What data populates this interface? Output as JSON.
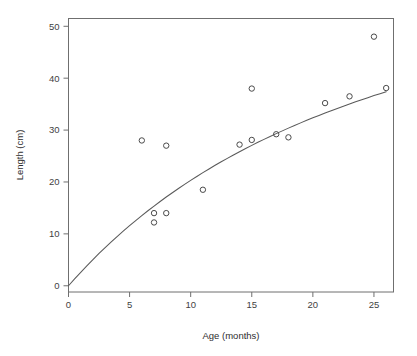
{
  "chart_data": {
    "type": "scatter",
    "title": "",
    "xlabel": "Age (months)",
    "ylabel": "Length (cm)",
    "xlim": [
      0,
      26.6
    ],
    "ylim": [
      -1.2,
      51.5
    ],
    "xticks": [
      0,
      5,
      10,
      15,
      20,
      25
    ],
    "xticklabels": [
      "0",
      "5",
      "10",
      "15",
      "20",
      "25"
    ],
    "yticks": [
      0,
      10,
      20,
      30,
      40,
      50
    ],
    "yticklabels": [
      "0",
      "10",
      "20",
      "30",
      "40",
      "50"
    ],
    "grid": false,
    "legend": false,
    "marker": "open-circle",
    "points": [
      {
        "x": 6.0,
        "y": 28.0
      },
      {
        "x": 7.0,
        "y": 14.0
      },
      {
        "x": 7.0,
        "y": 12.2
      },
      {
        "x": 8.0,
        "y": 27.0
      },
      {
        "x": 8.0,
        "y": 14.0
      },
      {
        "x": 11.0,
        "y": 18.5
      },
      {
        "x": 14.0,
        "y": 27.2
      },
      {
        "x": 15.0,
        "y": 28.1
      },
      {
        "x": 15.0,
        "y": 38.0
      },
      {
        "x": 17.0,
        "y": 29.2
      },
      {
        "x": 18.0,
        "y": 28.6
      },
      {
        "x": 21.0,
        "y": 35.2
      },
      {
        "x": 23.0,
        "y": 36.5
      },
      {
        "x": 25.0,
        "y": 48.0
      },
      {
        "x": 26.0,
        "y": 38.1
      }
    ],
    "fit_curve": {
      "name": "fitted growth curve",
      "x": [
        0.0,
        0.5,
        1.0,
        1.5,
        2.0,
        2.5,
        3.0,
        3.5,
        4.0,
        4.5,
        5.0,
        5.5,
        6.0,
        6.5,
        7.0,
        7.5,
        8.0,
        8.5,
        9.0,
        9.5,
        10.0,
        10.5,
        11.0,
        11.5,
        12.0,
        12.5,
        13.0,
        13.5,
        14.0,
        14.5,
        15.0,
        15.5,
        16.0,
        16.5,
        17.0,
        17.5,
        18.0,
        18.5,
        19.0,
        19.5,
        20.0,
        20.5,
        21.0,
        21.5,
        22.0,
        22.5,
        23.0,
        23.5,
        24.0,
        24.5,
        25.0,
        25.5,
        26.0
      ],
      "y": [
        0.0,
        1.32,
        2.6,
        3.84,
        5.05,
        6.22,
        7.35,
        8.46,
        9.53,
        10.57,
        11.58,
        12.57,
        13.52,
        14.45,
        15.36,
        16.24,
        17.1,
        17.93,
        18.75,
        19.54,
        20.31,
        21.06,
        21.8,
        22.51,
        23.21,
        23.89,
        24.55,
        25.2,
        25.83,
        26.45,
        27.05,
        27.64,
        28.21,
        28.77,
        29.32,
        29.85,
        30.38,
        30.89,
        31.39,
        31.88,
        32.36,
        32.83,
        33.29,
        33.74,
        34.18,
        34.61,
        35.03,
        35.45,
        35.85,
        36.25,
        36.64,
        37.02,
        37.4
      ]
    }
  },
  "colors": {
    "background": "#ffffff",
    "axis": "#6f6f6f",
    "marker": "#4a4a4a",
    "curve": "#5a5a5a",
    "text": "#3a3a3a"
  }
}
